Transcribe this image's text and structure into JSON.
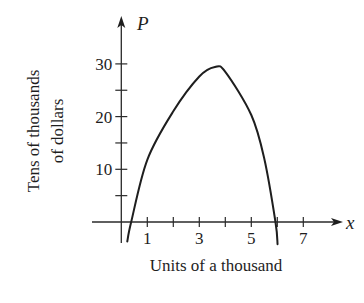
{
  "chart_data": {
    "type": "line",
    "title": "",
    "xlabel": "Units of a thousand",
    "ylabel": "Tens of thousands of dollars",
    "ylabel_lines": [
      "Tens of thousands",
      "of dollars"
    ],
    "x_variable": "x",
    "y_variable": "P",
    "xlim": [
      -0.4,
      8.4
    ],
    "ylim": [
      -6,
      39
    ],
    "x_ticks": [
      1,
      2,
      3,
      4,
      5,
      6,
      7
    ],
    "x_tick_labels": [
      "1",
      "3",
      "5",
      "7"
    ],
    "x_tick_label_values": [
      1,
      3,
      5,
      7
    ],
    "y_ticks": [
      5,
      10,
      15,
      20,
      25,
      30
    ],
    "y_tick_labels": [
      "10",
      "20",
      "30"
    ],
    "y_tick_label_values": [
      10,
      20,
      30
    ],
    "grid": false,
    "legend": null,
    "series": [
      {
        "name": "P",
        "x": [
          0.23,
          0.38,
          1,
          2,
          3,
          3.6,
          4,
          5,
          5.5,
          5.93,
          6.01
        ],
        "values": [
          -3.7,
          0,
          11.8,
          21,
          27.6,
          29.4,
          28.5,
          20.3,
          12,
          0,
          -4.2
        ]
      }
    ]
  }
}
